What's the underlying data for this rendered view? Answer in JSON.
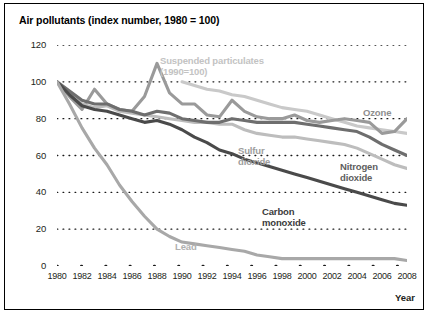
{
  "figure": {
    "title": "Air pollutants (index number, 1980 = 100)",
    "xaxis_title": "Year"
  },
  "axis": {
    "yticks": [
      "120",
      "100",
      "80",
      "60",
      "40",
      "20",
      "0"
    ],
    "xticks": [
      "1980",
      "1982",
      "1984",
      "1986",
      "1988",
      "1990",
      "1992",
      "1994",
      "1996",
      "1998",
      "2000",
      "2002",
      "2004",
      "2006",
      "2008"
    ]
  },
  "labels": {
    "suspended": "Suspended particulates\n(1990=100)",
    "ozone": "Ozone",
    "sulfur": "Sulfur\ndioxide",
    "nitrogen": "Nitrogen\ndioxide",
    "carbon": "Carbon\nmonoxide",
    "lead": "Lead"
  },
  "colors": {
    "suspended": "#c9c9c9",
    "ozone": "#9a9a9a",
    "sulfur": "#bdbdbd",
    "nitrogen": "#6e6e6e",
    "carbon": "#4a4a4a",
    "lead": "#a8a8a8",
    "grid": "#1a1a1a",
    "frame": "#000000"
  },
  "chart_data": {
    "type": "line",
    "title": "Air pollutants (index number, 1980 = 100)",
    "xlabel": "Year",
    "ylabel": "",
    "xlim": [
      1980,
      2008
    ],
    "ylim": [
      0,
      120
    ],
    "grid": true,
    "legend": "inline-annotations",
    "x": [
      1980,
      1981,
      1982,
      1983,
      1984,
      1985,
      1986,
      1987,
      1988,
      1989,
      1990,
      1991,
      1992,
      1993,
      1994,
      1995,
      1996,
      1997,
      1998,
      1999,
      2000,
      2001,
      2002,
      2003,
      2004,
      2005,
      2006,
      2007,
      2008
    ],
    "series": [
      {
        "name": "Suspended particulates",
        "note": "(1990=100)",
        "color": "#c9c9c9",
        "start_year": 1990,
        "values": [
          null,
          null,
          null,
          null,
          null,
          null,
          null,
          null,
          null,
          null,
          100,
          98,
          96,
          95,
          93,
          92,
          90,
          88,
          86,
          85,
          84,
          82,
          80,
          78,
          76,
          75,
          74,
          73,
          72
        ]
      },
      {
        "name": "Ozone",
        "color": "#9a9a9a",
        "values": [
          100,
          92,
          85,
          96,
          88,
          85,
          84,
          92,
          110,
          94,
          88,
          88,
          82,
          81,
          90,
          84,
          81,
          80,
          80,
          82,
          79,
          78,
          79,
          80,
          79,
          78,
          72,
          73,
          80
        ]
      },
      {
        "name": "Sulfur dioxide",
        "color": "#bdbdbd",
        "values": [
          100,
          94,
          88,
          86,
          87,
          84,
          83,
          82,
          81,
          80,
          79,
          78,
          78,
          77,
          77,
          74,
          72,
          71,
          70,
          70,
          69,
          68,
          67,
          66,
          64,
          61,
          58,
          55,
          53
        ]
      },
      {
        "name": "Nitrogen dioxide",
        "color": "#6e6e6e",
        "values": [
          100,
          95,
          90,
          88,
          88,
          85,
          84,
          82,
          84,
          83,
          80,
          79,
          78,
          78,
          80,
          79,
          78,
          78,
          78,
          78,
          77,
          76,
          75,
          74,
          73,
          70,
          66,
          63,
          60
        ]
      },
      {
        "name": "Carbon monoxide",
        "color": "#4a4a4a",
        "values": [
          100,
          93,
          87,
          85,
          84,
          82,
          80,
          78,
          79,
          77,
          74,
          70,
          67,
          63,
          61,
          58,
          56,
          54,
          52,
          50,
          48,
          46,
          44,
          42,
          40,
          38,
          36,
          34,
          33
        ]
      },
      {
        "name": "Lead",
        "color": "#a8a8a8",
        "values": [
          100,
          88,
          75,
          64,
          55,
          44,
          35,
          27,
          20,
          16,
          13,
          12,
          11,
          10,
          9,
          8,
          6,
          5,
          4,
          4,
          4,
          4,
          4,
          4,
          4,
          4,
          4,
          4,
          3
        ]
      }
    ]
  }
}
